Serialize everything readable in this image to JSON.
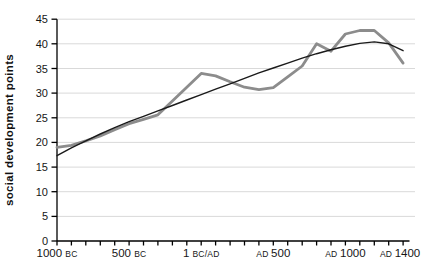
{
  "chart_data": {
    "type": "line",
    "title": "",
    "xlabel": "",
    "ylabel": "social development points",
    "ylim": [
      0,
      45
    ],
    "yticks": [
      0,
      5,
      10,
      15,
      20,
      25,
      30,
      35,
      40,
      45
    ],
    "xlim_years": [
      -1000,
      1400
    ],
    "minor_xtick_step_years": 100,
    "grid": "horizontal-only",
    "legend": "none",
    "colors": {
      "data_line": "#8c8c8c",
      "trend_line": "#1a1a1a",
      "gridline": "#d9d9d9",
      "axis": "#000000",
      "text": "#161616"
    },
    "x_ticks": [
      {
        "year": -1000,
        "parts": [
          {
            "text": "1000 ",
            "sm": false
          },
          {
            "text": "BC",
            "sm": true
          }
        ],
        "x_offset": 0
      },
      {
        "year": -500,
        "parts": [
          {
            "text": "500 ",
            "sm": false
          },
          {
            "text": "BC",
            "sm": true
          }
        ],
        "x_offset": 0
      },
      {
        "year": 0,
        "parts": [
          {
            "text": "1 ",
            "sm": false
          },
          {
            "text": "BC/AD",
            "sm": true
          }
        ],
        "x_offset": 0
      },
      {
        "year": 500,
        "parts": [
          {
            "text": "AD ",
            "sm": true
          },
          {
            "text": "500",
            "sm": false
          }
        ],
        "x_offset": 0
      },
      {
        "year": 1000,
        "parts": [
          {
            "text": "AD ",
            "sm": true
          },
          {
            "text": "1000",
            "sm": false
          }
        ],
        "x_offset": 0
      },
      {
        "year": 1400,
        "parts": [
          {
            "text": "AD ",
            "sm": true
          },
          {
            "text": "1400",
            "sm": false
          }
        ],
        "x_offset": -3
      }
    ],
    "x_years": [
      -1000,
      -900,
      -800,
      -700,
      -600,
      -500,
      -400,
      -300,
      -200,
      -100,
      0,
      100,
      200,
      300,
      400,
      500,
      600,
      700,
      800,
      900,
      1000,
      1100,
      1200,
      1300,
      1400
    ],
    "series": [
      {
        "name": "social-development-data",
        "color": "#8c8c8c",
        "width": 2.8,
        "values": [
          19.0,
          19.4,
          20.3,
          21.3,
          22.6,
          23.8,
          24.7,
          25.6,
          28.4,
          31.2,
          34.0,
          33.5,
          32.3,
          31.2,
          30.7,
          31.1,
          33.3,
          35.5,
          40.0,
          38.5,
          42.0,
          42.7,
          42.7,
          40.2,
          36.1
        ]
      },
      {
        "name": "trend-line",
        "color": "#1a1a1a",
        "width": 1.4,
        "values": [
          17.3,
          18.9,
          20.3,
          21.7,
          23.0,
          24.2,
          25.3,
          26.4,
          27.5,
          28.6,
          29.7,
          30.8,
          31.9,
          33.0,
          34.1,
          35.1,
          36.1,
          37.1,
          38.0,
          38.8,
          39.5,
          40.1,
          40.4,
          40.0,
          38.6
        ]
      }
    ]
  }
}
